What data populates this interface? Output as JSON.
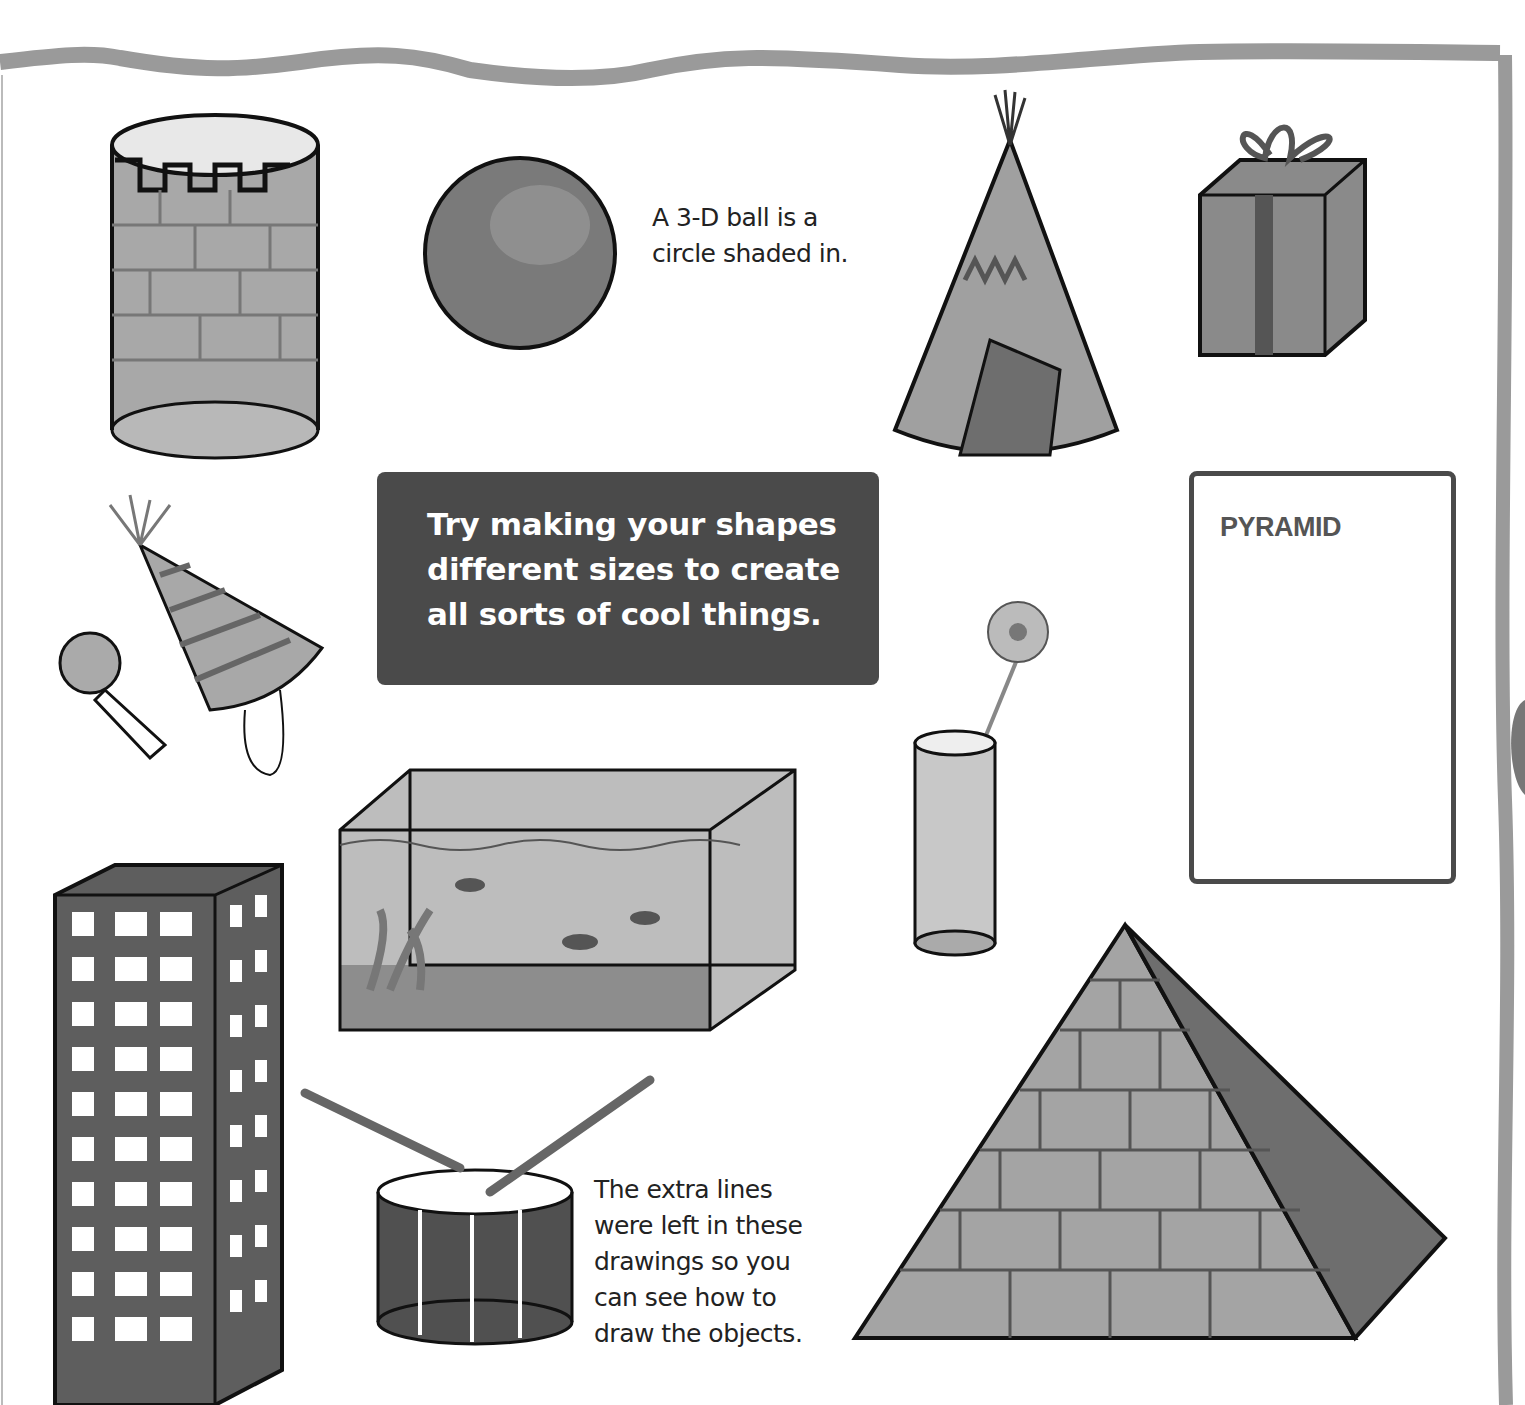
{
  "page": {
    "tip_box": {
      "lines": [
        "Try making your shapes",
        "different sizes to create",
        "all sorts of cool things."
      ]
    },
    "ball_caption": {
      "lines": [
        "A 3-D ball is a",
        "circle shaded in."
      ]
    },
    "extra_lines_caption": {
      "lines": [
        "The extra lines",
        "were left in these",
        "drawings so you",
        "can see how to",
        "draw the objects."
      ]
    },
    "pyramid_card": {
      "title": "PYRAMID"
    },
    "illustrations": [
      "castle-tower-cylinder",
      "shaded-ball",
      "teepee-cone",
      "gift-box-cube",
      "party-hat-and-blower",
      "flower-in-glass-vase",
      "fish-tank",
      "skyscraper-prism",
      "drum-with-sticks",
      "brick-pyramid"
    ],
    "colors": {
      "frame": "#9a9a9a",
      "tip_box_bg": "#4a4a4a",
      "card_border": "#4a4a4a",
      "ink": "#111111"
    }
  }
}
